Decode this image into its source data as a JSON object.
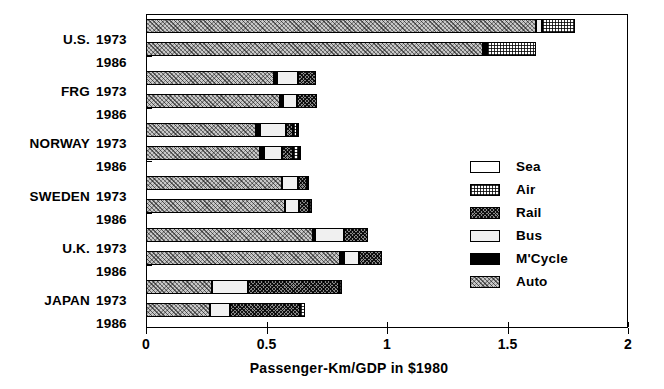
{
  "chart_data": {
    "type": "bar",
    "orientation": "horizontal",
    "stacked": true,
    "title": "",
    "xlabel": "Passenger-Km/GDP in $1980",
    "ylabel": "",
    "xlim": [
      0,
      2
    ],
    "xticks": [
      0,
      0.5,
      1,
      1.5,
      2
    ],
    "xtick_labels": [
      "0",
      "0.5",
      "1",
      "1.5",
      "2"
    ],
    "grid": false,
    "legend_position": "center-right",
    "legend": [
      "Sea",
      "Air",
      "Rail",
      "Bus",
      "M'Cycle",
      "Auto"
    ],
    "series": [
      {
        "name": "Auto",
        "values": [
          1.62,
          1.4,
          0.53,
          0.555,
          0.455,
          0.475,
          0.565,
          0.575,
          0.695,
          0.805,
          0.275,
          0.265
        ]
      },
      {
        "name": "M'Cycle",
        "values": [
          0.0,
          0.015,
          0.015,
          0.015,
          0.02,
          0.015,
          0.0,
          0.0,
          0.005,
          0.015,
          0.0,
          0.0
        ]
      },
      {
        "name": "Bus",
        "values": [
          0.025,
          0.0,
          0.085,
          0.055,
          0.105,
          0.075,
          0.065,
          0.06,
          0.12,
          0.065,
          0.15,
          0.085
        ]
      },
      {
        "name": "Rail",
        "values": [
          0.0,
          0.0,
          0.075,
          0.085,
          0.03,
          0.045,
          0.04,
          0.04,
          0.1,
          0.095,
          0.375,
          0.29
        ]
      },
      {
        "name": "Air",
        "values": [
          0.135,
          0.205,
          0.0,
          0.0,
          0.015,
          0.025,
          0.005,
          0.015,
          0.0,
          0.0,
          0.015,
          0.02
        ]
      },
      {
        "name": "Sea",
        "values": [
          0.0,
          0.0,
          0.0,
          0.0,
          0.005,
          0.005,
          0.0,
          0.0,
          0.0,
          0.0,
          0.0,
          0.0
        ]
      }
    ],
    "categories": [
      {
        "country": "U.S.",
        "year": "1973",
        "total": 1.78
      },
      {
        "country": "",
        "year": "1986",
        "total": 1.62
      },
      {
        "country": "FRG",
        "year": "1973",
        "total": 0.705
      },
      {
        "country": "",
        "year": "1986",
        "total": 0.71
      },
      {
        "country": "NORWAY",
        "year": "1973",
        "total": 0.63
      },
      {
        "country": "",
        "year": "1986",
        "total": 0.64
      },
      {
        "country": "SWEDEN",
        "year": "1973",
        "total": 0.675
      },
      {
        "country": "",
        "year": "1986",
        "total": 0.69
      },
      {
        "country": "U.K.",
        "year": "1973",
        "total": 0.92
      },
      {
        "country": "",
        "year": "1986",
        "total": 0.98
      },
      {
        "country": "JAPAN",
        "year": "1973",
        "total": 0.815
      },
      {
        "country": "",
        "year": "1986",
        "total": 0.66
      }
    ]
  },
  "axis": {
    "x_title": "Passenger-Km/GDP in $1980",
    "tick_labels": [
      "0",
      "0.5",
      "1",
      "1.5",
      "2"
    ]
  },
  "legend": {
    "items": [
      {
        "label": "Sea",
        "pattern": "sea"
      },
      {
        "label": "Air",
        "pattern": "air"
      },
      {
        "label": "Rail",
        "pattern": "rail"
      },
      {
        "label": "Bus",
        "pattern": "bus"
      },
      {
        "label": "M'Cycle",
        "pattern": "mcycle"
      },
      {
        "label": "Auto",
        "pattern": "auto"
      }
    ]
  }
}
